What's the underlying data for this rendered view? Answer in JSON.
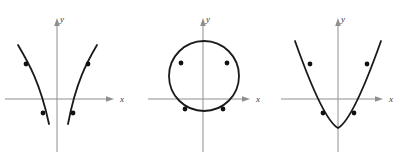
{
  "figure": {
    "panel_count": 3,
    "background_color": "#ffffff",
    "curve_color": "#1a1a1a",
    "axis_color": "#8e8e8e",
    "point_color": "#111111"
  },
  "panels": [
    {
      "id": "hyperbola",
      "curve_type": "hyperbola",
      "description": "Hyperbola with two branches opening left and right",
      "x_axis_label": "x",
      "y_axis_label": "y",
      "origin": {
        "x": 57,
        "y": 99
      },
      "branches": [
        {
          "name": "left-branch",
          "path": "M 18,45 C 28,62 40,82 49,124"
        },
        {
          "name": "right-branch",
          "path": "M 97,45 C 87,62 76,82 68,124"
        }
      ],
      "points": [
        {
          "label": "upper-left",
          "x": 26,
          "y": 64
        },
        {
          "label": "upper-right",
          "x": 88,
          "y": 64
        },
        {
          "label": "lower-left",
          "x": 43,
          "y": 113
        },
        {
          "label": "lower-right",
          "x": 73,
          "y": 113
        }
      ]
    },
    {
      "id": "circle",
      "curve_type": "circle",
      "description": "Circle centered above the origin crossing the x-axis",
      "x_axis_label": "x",
      "y_axis_label": "y",
      "origin": {
        "x": 63,
        "y": 99
      },
      "center": {
        "x": 64,
        "y": 76
      },
      "radius": 35,
      "points": [
        {
          "label": "upper-left",
          "x": 41,
          "y": 63
        },
        {
          "label": "upper-right",
          "x": 87,
          "y": 63
        },
        {
          "label": "lower-left",
          "x": 45,
          "y": 109
        },
        {
          "label": "lower-right",
          "x": 83,
          "y": 109
        }
      ]
    },
    {
      "id": "parabola",
      "curve_type": "parabola",
      "description": "Upward-opening parabola with vertex below the x-axis",
      "x_axis_label": "x",
      "y_axis_label": "y",
      "origin": {
        "x": 65,
        "y": 99
      },
      "vertex": {
        "x": 65,
        "y": 128
      },
      "path": "M 22,41 C 33,72 52,121 65,128 C 78,121 97,72 108,41",
      "points": [
        {
          "label": "upper-left",
          "x": 37,
          "y": 64
        },
        {
          "label": "upper-right",
          "x": 94,
          "y": 64
        },
        {
          "label": "lower-left",
          "x": 50,
          "y": 113
        },
        {
          "label": "lower-right",
          "x": 81,
          "y": 113
        }
      ]
    }
  ]
}
